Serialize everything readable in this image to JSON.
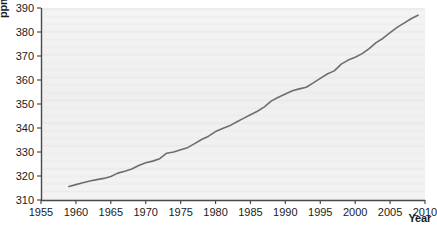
{
  "chart_data": {
    "type": "line",
    "title": "",
    "xlabel": "Year",
    "ylabel": "ppm",
    "xlim": [
      1955,
      2010
    ],
    "ylim": [
      310,
      390
    ],
    "xticks": [
      1955,
      1960,
      1965,
      1970,
      1975,
      1980,
      1985,
      1990,
      1995,
      2000,
      2005,
      2010
    ],
    "yticks": [
      310,
      320,
      330,
      340,
      350,
      360,
      370,
      380,
      390
    ],
    "grid": false,
    "legend": null,
    "line_color": "#6e6e6e",
    "plot_background": "#f2f2f2",
    "series": [
      {
        "name": "Atmospheric CO2 concentration",
        "x": [
          1959,
          1960,
          1961,
          1962,
          1963,
          1964,
          1965,
          1966,
          1967,
          1968,
          1969,
          1970,
          1971,
          1972,
          1973,
          1974,
          1975,
          1976,
          1977,
          1978,
          1979,
          1980,
          1981,
          1982,
          1983,
          1984,
          1985,
          1986,
          1987,
          1988,
          1989,
          1990,
          1991,
          1992,
          1993,
          1994,
          1995,
          1996,
          1997,
          1998,
          1999,
          2000,
          2001,
          2002,
          2003,
          2004,
          2005,
          2006,
          2007,
          2008,
          2009
        ],
        "values": [
          315.6,
          316.4,
          317.2,
          317.9,
          318.5,
          319.0,
          319.8,
          321.2,
          322.0,
          322.9,
          324.4,
          325.5,
          326.2,
          327.2,
          329.5,
          330.0,
          330.9,
          331.8,
          333.5,
          335.2,
          336.6,
          338.5,
          339.8,
          340.9,
          342.5,
          344.0,
          345.5,
          347.0,
          348.8,
          351.3,
          352.8,
          354.2,
          355.5,
          356.3,
          357.0,
          358.8,
          360.7,
          362.5,
          363.8,
          366.6,
          368.3,
          369.5,
          371.0,
          373.1,
          375.6,
          377.4,
          379.7,
          381.9,
          383.7,
          385.5,
          387.0
        ]
      }
    ]
  },
  "axes": {
    "y_axis_title": "ppm",
    "x_axis_title": "Year"
  }
}
